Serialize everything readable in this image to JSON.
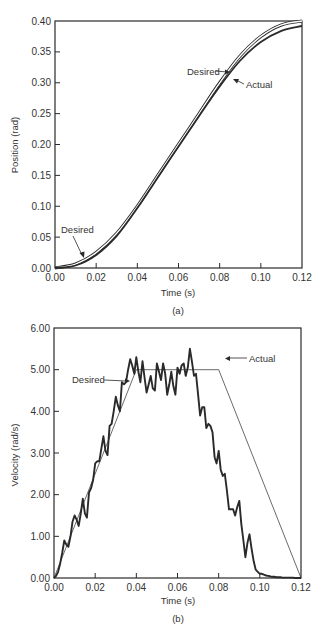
{
  "figure": {
    "background": "#ffffff",
    "line_color": "#2a2a2a"
  },
  "chart_data": [
    {
      "type": "line",
      "id": "a",
      "caption": "(a)",
      "title": "",
      "xlabel": "Time (s)",
      "ylabel": "Position (rad)",
      "xlim": [
        0.0,
        0.12
      ],
      "ylim": [
        0.0,
        0.4
      ],
      "xticks": [
        "0.00",
        "0.02",
        "0.04",
        "0.06",
        "0.08",
        "0.10",
        "0.12"
      ],
      "yticks": [
        "0.00",
        "0.05",
        "0.10",
        "0.15",
        "0.20",
        "0.25",
        "0.30",
        "0.35",
        "0.40"
      ],
      "grid": false,
      "legend": "none (inline annotations with arrows)",
      "annotations": [
        {
          "text": "Desired",
          "target": "desired curve near t=0.092, pos≈0.325"
        },
        {
          "text": "Actual",
          "target": "actual curve near t=0.095, pos≈0.305"
        },
        {
          "text": "Desired",
          "target": "desired curve near t=0.015, pos≈0.012"
        }
      ],
      "series": [
        {
          "name": "Desired",
          "style": "thin double line (outlined)",
          "x": [
            0.0,
            0.01,
            0.02,
            0.03,
            0.04,
            0.05,
            0.06,
            0.07,
            0.08,
            0.09,
            0.1,
            0.11,
            0.12
          ],
          "values": [
            0.0,
            0.00625,
            0.025,
            0.05625,
            0.1,
            0.15,
            0.2,
            0.25,
            0.3,
            0.34375,
            0.375,
            0.39375,
            0.4
          ]
        },
        {
          "name": "Actual",
          "style": "thick solid line",
          "x": [
            0.0,
            0.01,
            0.02,
            0.03,
            0.04,
            0.05,
            0.06,
            0.07,
            0.08,
            0.09,
            0.1,
            0.11,
            0.12
          ],
          "values": [
            0.0,
            0.004,
            0.021,
            0.052,
            0.097,
            0.147,
            0.197,
            0.246,
            0.294,
            0.336,
            0.366,
            0.384,
            0.392
          ]
        }
      ]
    },
    {
      "type": "line",
      "id": "b",
      "caption": "(b)",
      "title": "",
      "xlabel": "Time (s)",
      "ylabel": "Velocity (rad/s)",
      "xlim": [
        0.0,
        0.12
      ],
      "ylim": [
        0.0,
        6.0
      ],
      "xticks": [
        "0.00",
        "0.02",
        "0.04",
        "0.06",
        "0.08",
        "0.10",
        "0.12"
      ],
      "yticks": [
        "0.00",
        "1.00",
        "2.00",
        "3.00",
        "4.00",
        "5.00",
        "6.00"
      ],
      "grid": false,
      "legend": "none (inline annotations with arrows)",
      "annotations": [
        {
          "text": "Desired",
          "target": "desired line near t=0.038, vel≈4.8"
        },
        {
          "text": "Actual",
          "target": "actual peak near t=0.082, vel≈5.3"
        }
      ],
      "series": [
        {
          "name": "Desired",
          "style": "thin line",
          "x": [
            0.0,
            0.04,
            0.08,
            0.12
          ],
          "values": [
            0.0,
            5.0,
            5.0,
            0.0
          ]
        },
        {
          "name": "Actual",
          "style": "thick noisy line",
          "x": [
            0.0,
            0.001,
            0.002,
            0.003,
            0.004,
            0.005,
            0.006,
            0.007,
            0.008,
            0.009,
            0.01,
            0.011,
            0.012,
            0.013,
            0.014,
            0.015,
            0.016,
            0.017,
            0.018,
            0.019,
            0.02,
            0.021,
            0.022,
            0.023,
            0.024,
            0.025,
            0.026,
            0.027,
            0.028,
            0.029,
            0.03,
            0.031,
            0.032,
            0.033,
            0.034,
            0.035,
            0.036,
            0.037,
            0.038,
            0.039,
            0.04,
            0.041,
            0.042,
            0.043,
            0.044,
            0.045,
            0.046,
            0.047,
            0.048,
            0.049,
            0.05,
            0.051,
            0.052,
            0.053,
            0.054,
            0.055,
            0.056,
            0.057,
            0.058,
            0.059,
            0.06,
            0.061,
            0.062,
            0.063,
            0.064,
            0.065,
            0.066,
            0.067,
            0.068,
            0.069,
            0.07,
            0.071,
            0.072,
            0.073,
            0.074,
            0.075,
            0.076,
            0.077,
            0.078,
            0.079,
            0.08,
            0.081,
            0.082,
            0.083,
            0.084,
            0.085,
            0.086,
            0.087,
            0.088,
            0.089,
            0.09,
            0.091,
            0.092,
            0.093,
            0.094,
            0.095,
            0.096,
            0.097,
            0.098,
            0.099,
            0.1,
            0.101,
            0.102,
            0.103,
            0.104,
            0.105,
            0.106,
            0.107,
            0.108,
            0.109,
            0.11,
            0.111,
            0.112,
            0.113,
            0.114,
            0.115,
            0.116,
            0.117,
            0.118,
            0.119,
            0.12
          ],
          "values": [
            0.0,
            0.05,
            0.15,
            0.35,
            0.6,
            0.9,
            0.8,
            0.75,
            1.0,
            1.35,
            1.5,
            1.4,
            1.25,
            1.55,
            1.9,
            1.55,
            1.45,
            2.05,
            2.15,
            2.35,
            2.75,
            2.8,
            2.8,
            3.1,
            3.4,
            3.05,
            2.95,
            3.65,
            3.7,
            4.0,
            4.35,
            4.15,
            4.0,
            4.7,
            4.65,
            4.7,
            5.0,
            5.25,
            5.1,
            4.9,
            5.3,
            4.95,
            4.7,
            5.2,
            4.8,
            4.45,
            4.65,
            4.85,
            4.55,
            4.5,
            5.15,
            4.95,
            4.75,
            5.15,
            4.9,
            4.4,
            4.65,
            4.95,
            4.6,
            4.4,
            5.05,
            4.9,
            5.1,
            5.15,
            4.85,
            5.05,
            5.5,
            5.2,
            4.85,
            4.9,
            4.4,
            3.9,
            4.1,
            4.1,
            3.6,
            3.7,
            3.65,
            3.5,
            2.9,
            2.75,
            3.05,
            2.6,
            2.45,
            2.5,
            2.1,
            1.65,
            1.65,
            1.65,
            1.5,
            1.7,
            1.85,
            1.3,
            0.9,
            0.5,
            0.85,
            1.05,
            0.7,
            0.4,
            0.2,
            0.15,
            0.1,
            0.1,
            0.08,
            0.06,
            0.05,
            0.04,
            0.03,
            0.03,
            0.02,
            0.02,
            0.02,
            0.01,
            0.01,
            0.01,
            0.01,
            0.01,
            0.01,
            0.0,
            0.0,
            0.0,
            0.0
          ]
        }
      ]
    }
  ]
}
